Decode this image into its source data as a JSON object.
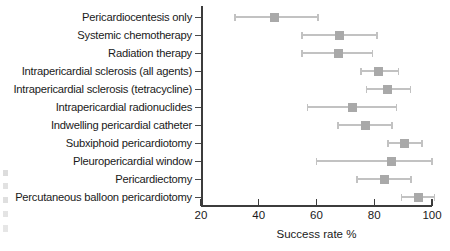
{
  "chart_data": {
    "type": "scatter",
    "title": "",
    "xlabel": "Success rate %",
    "ylabel": "",
    "xlim": [
      20,
      100
    ],
    "xticks": [
      20,
      40,
      60,
      80,
      100
    ],
    "grid": false,
    "legend": null,
    "marker_color": "#a9a9a9",
    "whisker_color": "#c2c2c2",
    "axis_color": "#3c3c3c",
    "categories": [
      "Pericardiocentesis only",
      "Systemic chemotherapy",
      "Radiation therapy",
      "Intrapericardial sclerosis (all agents)",
      "Intrapericardial sclerosis (tetracycline)",
      "Intrapericardial radionuclides",
      "Indwelling pericardial catheter",
      "Subxiphoid pericardiotomy",
      "Pleuropericardial window",
      "Pericardiectomy",
      "Percutaneous balloon pericardiotomy"
    ],
    "values": [
      45.6,
      68.0,
      67.5,
      81.6,
      84.7,
      72.6,
      76.8,
      90.6,
      86.0,
      83.4,
      95.4
    ],
    "ci_low": [
      31.8,
      55.0,
      55.0,
      75.4,
      77.4,
      57.0,
      67.4,
      84.8,
      60.0,
      74.0,
      89.5
    ],
    "ci_high": [
      60.5,
      81.0,
      79.5,
      88.5,
      92.6,
      87.8,
      86.1,
      96.5,
      100.0,
      92.7,
      100.8
    ]
  }
}
